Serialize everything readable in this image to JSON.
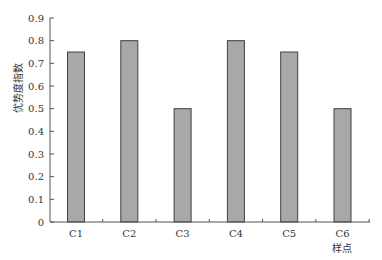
{
  "chart_data": {
    "type": "bar",
    "title": "",
    "xlabel": "样点",
    "ylabel": "优势度指数",
    "categories": [
      "C1",
      "C2",
      "C3",
      "C4",
      "C5",
      "C6"
    ],
    "values": [
      0.75,
      0.8,
      0.5,
      0.8,
      0.75,
      0.5
    ],
    "ylim": [
      0,
      0.9
    ],
    "yticks": [
      "0",
      "0.1",
      "0.2",
      "0.3",
      "0.4",
      "0.5",
      "0.6",
      "0.7",
      "0.8",
      "0.9"
    ],
    "grid": false,
    "legend": null,
    "colors": {
      "bar_fill": "#a8a8a8",
      "bar_stroke": "#404040",
      "axis": "#555555"
    }
  }
}
